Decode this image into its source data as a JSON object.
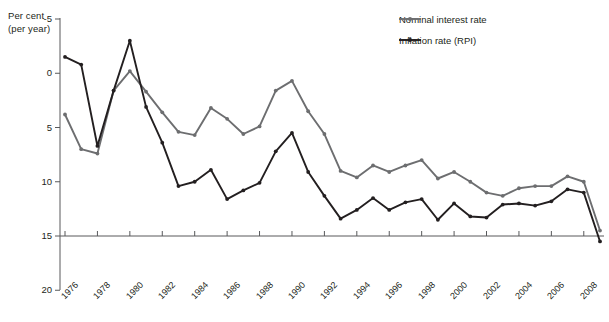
{
  "axis": {
    "ylabel_line1": "Per cent",
    "ylabel_line2": "(per year)",
    "yticks": [
      "20",
      "15",
      "10",
      "5",
      "0",
      "-5"
    ],
    "xticks": [
      "1976",
      "1978",
      "1980",
      "1982",
      "1984",
      "1986",
      "1988",
      "1990",
      "1992",
      "1994",
      "1996",
      "1998",
      "2000",
      "2002",
      "2004",
      "2006",
      "2008"
    ]
  },
  "legend": {
    "items": [
      {
        "label": "Nominal interest rate",
        "color": "#6d6e70"
      },
      {
        "label": "Inflation rate (RPI)",
        "color": "#231f20"
      }
    ]
  },
  "colors": {
    "nominal": "#6d6e70",
    "inflation": "#231f20",
    "axis": "#58595b",
    "background": "#ffffff"
  },
  "chart_data": {
    "type": "line",
    "title": "",
    "subtitle": "",
    "xlabel": "",
    "ylabel": "Per cent (per year)",
    "ylim": [
      -5,
      20
    ],
    "yticks": [
      -5,
      0,
      5,
      10,
      15,
      20
    ],
    "xlim": [
      1976,
      2009
    ],
    "xtick_values": [
      1976,
      1978,
      1980,
      1982,
      1984,
      1986,
      1988,
      1990,
      1992,
      1994,
      1996,
      1998,
      2000,
      2002,
      2004,
      2006,
      2008
    ],
    "grid": false,
    "legend_position": "top-right",
    "x": [
      1976,
      1977,
      1978,
      1979,
      1980,
      1981,
      1982,
      1983,
      1984,
      1985,
      1986,
      1987,
      1988,
      1989,
      1990,
      1991,
      1992,
      1993,
      1994,
      1995,
      1996,
      1997,
      1998,
      1999,
      2000,
      2001,
      2002,
      2003,
      2004,
      2005,
      2006,
      2007,
      2008,
      2009
    ],
    "series": [
      {
        "name": "Nominal interest rate",
        "color": "#6d6e70",
        "values": [
          11.2,
          8.0,
          7.6,
          13.4,
          15.2,
          13.3,
          11.4,
          9.6,
          9.3,
          11.8,
          10.8,
          9.4,
          10.1,
          13.4,
          14.3,
          11.5,
          9.4,
          6.0,
          5.4,
          6.5,
          5.9,
          6.5,
          7.0,
          5.3,
          5.9,
          5.0,
          4.0,
          3.7,
          4.4,
          4.6,
          4.6,
          5.5,
          5.0,
          0.5
        ],
        "marker": "circle"
      },
      {
        "name": "Inflation rate (RPI)",
        "color": "#231f20",
        "values": [
          16.5,
          15.8,
          8.3,
          13.4,
          18.0,
          11.9,
          8.6,
          4.6,
          5.0,
          6.1,
          3.4,
          4.2,
          4.9,
          7.8,
          9.5,
          5.9,
          3.7,
          1.6,
          2.4,
          3.5,
          2.4,
          3.1,
          3.4,
          1.5,
          3.0,
          1.8,
          1.7,
          2.9,
          3.0,
          2.8,
          3.2,
          4.3,
          4.0,
          -0.5
        ],
        "marker": "circle"
      }
    ]
  }
}
